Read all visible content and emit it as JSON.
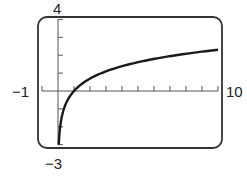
{
  "chart_data": {
    "type": "line",
    "title": "",
    "xlabel": "",
    "ylabel": "",
    "xlim": [
      -1,
      10
    ],
    "ylim": [
      -3,
      4
    ],
    "xscale": 1,
    "yscale": 1,
    "grid": false,
    "function": "y = ln(x)",
    "series": [
      {
        "name": "y = ln x",
        "x": [
          0.05,
          0.1,
          0.2,
          0.3,
          0.5,
          0.75,
          1,
          1.5,
          2,
          3,
          4,
          5,
          6,
          7,
          8,
          9,
          10
        ],
        "y": [
          -3.0,
          -2.3,
          -1.61,
          -1.2,
          -0.69,
          -0.29,
          0,
          0.41,
          0.69,
          1.1,
          1.39,
          1.61,
          1.79,
          1.95,
          2.08,
          2.2,
          2.3
        ]
      }
    ],
    "window_labels": {
      "xmin": "−1",
      "xmax": "10",
      "ymin": "−3",
      "ymax": "4"
    }
  }
}
